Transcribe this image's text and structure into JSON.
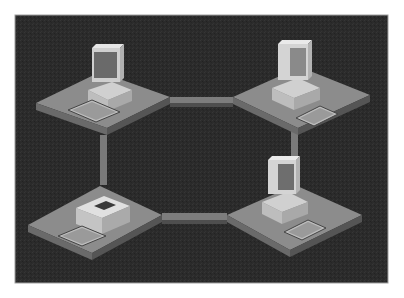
{
  "diagram": {
    "type": "ring-network-topology",
    "colors": {
      "background": "#2b2b2b",
      "platform_top": "#8c8c8c",
      "platform_side": "#5e5e5e",
      "link": "#7d7d7d",
      "device_light": "#d9d9d9",
      "device_mid": "#b5b5b5",
      "screen": "#6a6a6a"
    },
    "nodes": [
      {
        "id": "node-top-left",
        "device": "desktop-computer"
      },
      {
        "id": "node-top-right",
        "device": "desktop-computer"
      },
      {
        "id": "node-bottom-right",
        "device": "desktop-computer"
      },
      {
        "id": "node-bottom-left",
        "device": "chip-device-with-keyboard"
      }
    ],
    "links": [
      {
        "from": "node-top-left",
        "to": "node-top-right"
      },
      {
        "from": "node-top-right",
        "to": "node-bottom-right"
      },
      {
        "from": "node-bottom-right",
        "to": "node-bottom-left"
      },
      {
        "from": "node-bottom-left",
        "to": "node-top-left"
      }
    ]
  }
}
